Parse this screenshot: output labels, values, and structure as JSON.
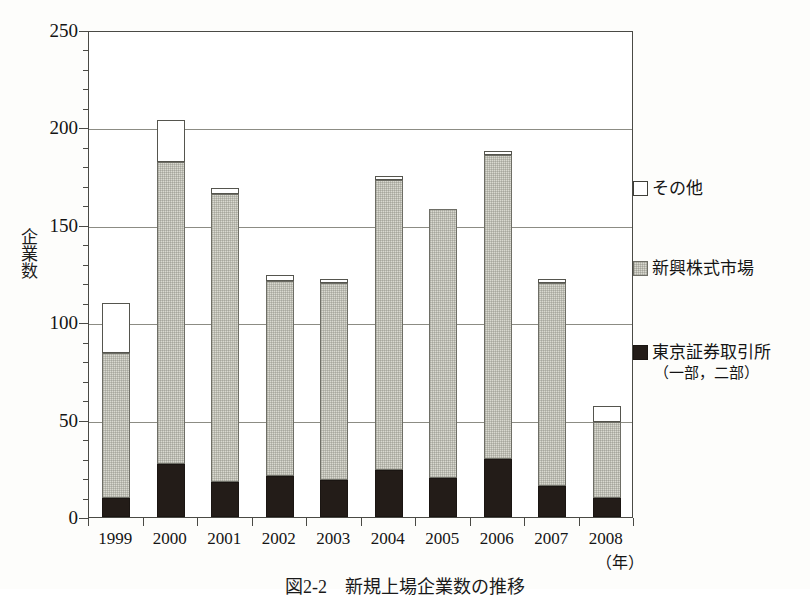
{
  "chart_data": {
    "type": "bar",
    "xlabel": "(年)",
    "ylabel": "企業数",
    "ylim": [
      0,
      250
    ],
    "yticks": [
      0,
      50,
      100,
      150,
      200,
      250
    ],
    "ytick_labels": [
      "0",
      "50",
      "100",
      "150",
      "200",
      "250"
    ],
    "grid": true,
    "stacked": true,
    "legend_position": "right",
    "categories": [
      "1999",
      "2000",
      "2001",
      "2002",
      "2003",
      "2004",
      "2005",
      "2006",
      "2007",
      "2008"
    ],
    "series": [
      {
        "name": "東京証券取引所（一部，二部）",
        "color": "#231c18",
        "values": [
          10,
          27,
          18,
          21,
          19,
          24,
          20,
          30,
          16,
          10
        ]
      },
      {
        "name": "新興株式市場",
        "color": "#d9d9d0",
        "values": [
          74,
          155,
          148,
          100,
          101,
          149,
          138,
          156,
          104,
          39
        ]
      },
      {
        "name": "その他",
        "color": "#ffffff",
        "values": [
          26,
          22,
          3,
          3,
          2,
          2,
          0,
          2,
          2,
          8
        ]
      }
    ],
    "totals": [
      110,
      204,
      169,
      124,
      122,
      175,
      158,
      188,
      122,
      57
    ]
  },
  "axes": {
    "y_title": "企業数",
    "x_unit": "（年）"
  },
  "legend": {
    "items": [
      {
        "label": "その他",
        "sub": "",
        "swatch": "white-square-icon"
      },
      {
        "label": "新興株式市場",
        "sub": "",
        "swatch": "gray-square-icon"
      },
      {
        "label": "東京証券取引所",
        "sub": "（一部，二部）",
        "swatch": "black-square-icon"
      }
    ]
  },
  "caption": {
    "text": "図2-2　新規上場企業数の推移"
  }
}
